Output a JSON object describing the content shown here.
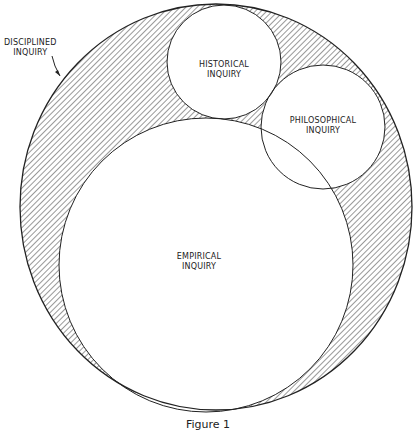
{
  "diagram": {
    "type": "venn",
    "outer": {
      "label_line1": "DISCIPLINED",
      "label_line2": "INQUIRY",
      "fill": "hatched"
    },
    "circles": [
      {
        "id": "historical",
        "label_line1": "HISTORICAL",
        "label_line2": "INQUIRY"
      },
      {
        "id": "philosophical",
        "label_line1": "PHILOSOPHICAL",
        "label_line2": "INQUIRY"
      },
      {
        "id": "empirical",
        "label_line1": "EMPIRICAL",
        "label_line2": "INQUIRY"
      }
    ],
    "caption": "Figure 1",
    "colors": {
      "stroke": "#222222",
      "hatch": "#444444",
      "background": "#ffffff"
    }
  }
}
